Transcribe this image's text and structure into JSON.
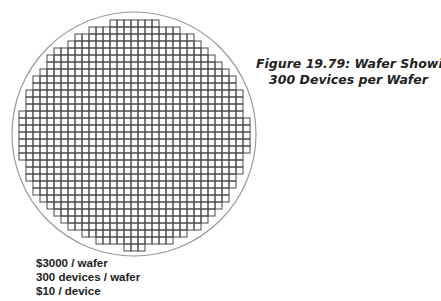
{
  "figure": {
    "caption_line1": "Figure 19.79: Wafer Showing",
    "caption_line2": "300 Devices per Wafer"
  },
  "wafer": {
    "center_x": 134,
    "center_y": 134,
    "radius": 122,
    "edge_color": "#9a9a9a",
    "grid_color": "#4a4a4a",
    "cell_pitch": 7,
    "grid_origin_x": 19,
    "grid_origin_y": 20,
    "columns": 33,
    "rows": 33,
    "die_radius_limit": 118
  },
  "cost_breakdown": [
    "$3000 / wafer",
    "300 devices / wafer",
    "$10 / device"
  ]
}
